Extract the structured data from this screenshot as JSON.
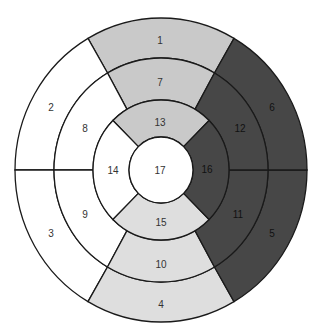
{
  "diagram": {
    "type": "bullseye-17-segment",
    "center": [
      161,
      170
    ],
    "radii_x": [
      146,
      107,
      68,
      32
    ],
    "radii_y": [
      152,
      112,
      70,
      33
    ],
    "colors": {
      "white": "#ffffff",
      "light_gray": "#c9c9c9",
      "pale_gray": "#dedede",
      "dark_gray": "#474747",
      "outline": "#1a1a1a",
      "label_dark": "#333333",
      "label_on_dark": "#111111"
    },
    "rings": [
      {
        "name": "basal",
        "ring_index": 0,
        "segments": [
          {
            "id": "1",
            "start": 60,
            "end": 120,
            "fill": "light_gray",
            "label_pos": [
              160,
              40
            ]
          },
          {
            "id": "2",
            "start": 120,
            "end": 180,
            "fill": "white",
            "label_pos": [
              51,
              107
            ]
          },
          {
            "id": "3",
            "start": 180,
            "end": 240,
            "fill": "white",
            "label_pos": [
              51,
              233
            ]
          },
          {
            "id": "4",
            "start": 240,
            "end": 300,
            "fill": "pale_gray",
            "label_pos": [
              161,
              304
            ]
          },
          {
            "id": "5",
            "start": 300,
            "end": 360,
            "fill": "dark_gray",
            "label_pos": [
              272,
              233
            ]
          },
          {
            "id": "6",
            "start": 0,
            "end": 60,
            "fill": "dark_gray",
            "label_pos": [
              272,
              107
            ]
          }
        ]
      },
      {
        "name": "mid",
        "ring_index": 1,
        "segments": [
          {
            "id": "7",
            "start": 60,
            "end": 120,
            "fill": "light_gray",
            "label_pos": [
              160,
              82
            ]
          },
          {
            "id": "8",
            "start": 120,
            "end": 180,
            "fill": "white",
            "label_pos": [
              85,
              128
            ]
          },
          {
            "id": "9",
            "start": 180,
            "end": 240,
            "fill": "white",
            "label_pos": [
              85,
              214
            ]
          },
          {
            "id": "10",
            "start": 240,
            "end": 300,
            "fill": "pale_gray",
            "label_pos": [
              161,
              264
            ]
          },
          {
            "id": "11",
            "start": 300,
            "end": 360,
            "fill": "dark_gray",
            "label_pos": [
              238,
              214
            ]
          },
          {
            "id": "12",
            "start": 0,
            "end": 60,
            "fill": "dark_gray",
            "label_pos": [
              240,
              128
            ]
          }
        ]
      },
      {
        "name": "apical",
        "ring_index": 2,
        "segments": [
          {
            "id": "13",
            "start": 45,
            "end": 135,
            "fill": "light_gray",
            "label_pos": [
              160,
              122
            ]
          },
          {
            "id": "14",
            "start": 135,
            "end": 225,
            "fill": "white",
            "label_pos": [
              113,
              170
            ]
          },
          {
            "id": "15",
            "start": 225,
            "end": 315,
            "fill": "pale_gray",
            "label_pos": [
              161,
              222
            ]
          },
          {
            "id": "16",
            "start": 315,
            "end": 405,
            "fill": "dark_gray",
            "label_pos": [
              207,
              169
            ]
          }
        ]
      }
    ],
    "apex": {
      "id": "17",
      "fill": "white",
      "label_pos": [
        160,
        170
      ]
    }
  }
}
